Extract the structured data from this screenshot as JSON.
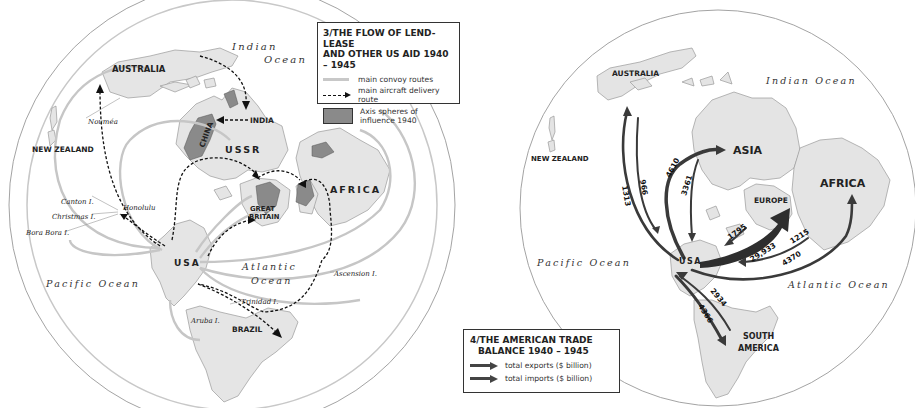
{
  "left_map": {
    "legend": {
      "title_line1": "3/THE FLOW OF LEND-LEASE",
      "title_line2": "AND OTHER US AID 1940 – 1945",
      "items": [
        {
          "label": "main convoy routes",
          "symbol": "light-gray-line"
        },
        {
          "label": "main aircraft delivery route",
          "symbol": "dashed-arrow"
        },
        {
          "label": "Axis spheres of influence 1940",
          "symbol": "gray-box"
        }
      ]
    },
    "regions": {
      "australia": "AUSTRALIA",
      "new_zealand": "NEW ZEALAND",
      "india": "INDIA",
      "china": "CHINA",
      "ussr": "USSR",
      "africa": "AFRICA",
      "great_britain_1": "GREAT",
      "great_britain_2": "BRITAIN",
      "usa": "USA",
      "brazil": "BRAZIL"
    },
    "places": {
      "noumea": "Nouméa",
      "canton": "Canton I.",
      "christmas": "Christmas I.",
      "bora_bora": "Bora Bora I.",
      "honolulu": "Honolulu",
      "ascension": "Ascension I.",
      "trinidad": "Trinidad I.",
      "aruba": "Aruba I."
    },
    "oceans": {
      "indian_1": "Indian",
      "indian_2": "Ocean",
      "atlantic_1": "Atlantic",
      "atlantic_2": "Ocean",
      "pacific": "Pacific Ocean"
    }
  },
  "right_map": {
    "legend": {
      "title_line1": "4/THE AMERICAN TRADE",
      "title_line2": "BALANCE 1940 – 1945",
      "items": [
        {
          "label": "total exports ($ billion)",
          "symbol": "dark-arrow"
        },
        {
          "label": "total imports ($ billion)",
          "symbol": "dark-arrow"
        }
      ]
    },
    "regions": {
      "australia": "AUSTRALIA",
      "new_zealand": "NEW ZEALAND",
      "asia": "ASIA",
      "europe": "EUROPE",
      "africa": "AFRICA",
      "usa": "USA",
      "south_america_1": "SOUTH",
      "south_america_2": "AMERICA"
    },
    "oceans": {
      "indian": "Indian Ocean",
      "pacific": "Pacific Ocean",
      "atlantic": "Atlantic Ocean"
    },
    "flows": {
      "australia_export": "1313",
      "australia_import": "966",
      "asia_export": "4610",
      "asia_import": "3361",
      "europe_export": "29,933",
      "europe_import": "1795",
      "africa_export": "1215",
      "africa_import": "4370",
      "south_america_export": "2934",
      "south_america_import": "4366"
    }
  },
  "colors": {
    "land": "#e4e4e4",
    "coast": "#9a9a9a",
    "convoy": "#c4c4c4",
    "axis": "#8a8a8a",
    "arrow": "#3a3a3a",
    "circle": "#8f8f8f"
  }
}
